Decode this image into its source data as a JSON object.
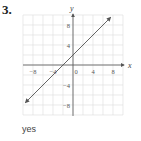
{
  "problem": {
    "number": "3.",
    "answer": "yes"
  },
  "graph": {
    "x_axis_label": "x",
    "y_axis_label": "y",
    "x_ticks": [
      "−8",
      "−4",
      "0",
      "4",
      "8"
    ],
    "y_ticks": [
      "8",
      "4",
      "−4",
      "−8"
    ],
    "range": [
      -10,
      10
    ],
    "grid_step": 2,
    "line": {
      "equation": "y = x + 2",
      "from": [
        -9.5,
        -7.5
      ],
      "to": [
        7.5,
        9.5
      ]
    }
  },
  "chart_data": {
    "type": "line",
    "title": "",
    "xlabel": "x",
    "ylabel": "y",
    "xlim": [
      -10,
      10
    ],
    "ylim": [
      -10,
      10
    ],
    "grid": true,
    "x_tick_labels": [
      -8,
      -4,
      0,
      4,
      8
    ],
    "y_tick_labels": [
      -8,
      -4,
      4,
      8
    ],
    "series": [
      {
        "name": "y = x + 2",
        "x": [
          -9.5,
          -2,
          0,
          7.5
        ],
        "y": [
          -7.5,
          0,
          2,
          9.5
        ]
      }
    ]
  },
  "colors": {
    "grid": "#dcdcdc",
    "axis": "#555555",
    "line": "#555555"
  }
}
